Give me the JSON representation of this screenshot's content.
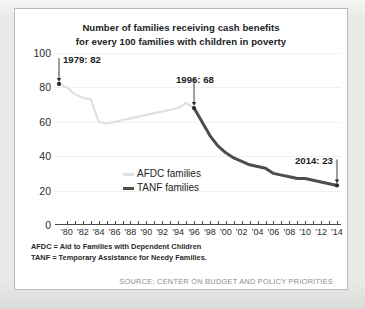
{
  "chart_data": {
    "type": "line",
    "title": "Number of families receiving cash benefits for every 100 families with children in poverty",
    "title_line1": "Number of families receiving cash benefits",
    "title_line2": "for every 100 families with children in poverty",
    "xlabel": "",
    "ylabel": "",
    "ylim": [
      0,
      100
    ],
    "xlim": [
      1979,
      2014
    ],
    "yticks": [
      0,
      20,
      40,
      60,
      80,
      100
    ],
    "ytick_labels": [
      "0",
      "20",
      "40",
      "60",
      "80",
      "100"
    ],
    "gridlines": [
      20,
      40,
      60,
      80,
      100
    ],
    "grid": true,
    "legend_position": "inside-center",
    "xticks": [
      1980,
      1981,
      1982,
      1983,
      1984,
      1985,
      1986,
      1987,
      1988,
      1989,
      1990,
      1991,
      1992,
      1993,
      1994,
      1995,
      1996,
      1997,
      1998,
      1999,
      2000,
      2001,
      2002,
      2003,
      2004,
      2005,
      2006,
      2007,
      2008,
      2009,
      2010,
      2011,
      2012,
      2013,
      2014
    ],
    "xtick_labels": [
      "'80",
      "'82",
      "'84",
      "'86",
      "'88",
      "'90",
      "'92",
      "'94",
      "'96",
      "'98",
      "'00",
      "'02",
      "'04",
      "'06",
      "'08",
      "'10",
      "'12",
      "'14"
    ],
    "xtick_label_years": [
      1980,
      1982,
      1984,
      1986,
      1988,
      1990,
      1992,
      1994,
      1996,
      1998,
      2000,
      2002,
      2004,
      2006,
      2008,
      2010,
      2012,
      2014
    ],
    "series": [
      {
        "name": "AFDC families",
        "color": "#e0e0e0",
        "x": [
          1979,
          1980,
          1981,
          1982,
          1983,
          1984,
          1985,
          1986,
          1987,
          1988,
          1989,
          1990,
          1991,
          1992,
          1993,
          1994,
          1995,
          1996
        ],
        "values": [
          82,
          80,
          76,
          74,
          73,
          60,
          59,
          60,
          61,
          62,
          63,
          64,
          65,
          66,
          67,
          68,
          71,
          68
        ]
      },
      {
        "name": "TANF families",
        "color": "#4d4d4d",
        "x": [
          1996,
          1997,
          1998,
          1999,
          2000,
          2001,
          2002,
          2003,
          2004,
          2005,
          2006,
          2007,
          2008,
          2009,
          2010,
          2011,
          2012,
          2013,
          2014
        ],
        "values": [
          68,
          60,
          52,
          46,
          42,
          39,
          37,
          35,
          34,
          33,
          30,
          29,
          28,
          27,
          27,
          26,
          25,
          24,
          23
        ]
      }
    ],
    "annotations": [
      {
        "label": "1979: 82",
        "year": 1979,
        "value": 82
      },
      {
        "label": "1996: 68",
        "year": 1996,
        "value": 68
      },
      {
        "label": "2014: 23",
        "year": 2014,
        "value": 23
      }
    ]
  },
  "legend": [
    {
      "label": "AFDC families",
      "color": "#e0e0e0"
    },
    {
      "label": "TANF families",
      "color": "#4d4d4d"
    }
  ],
  "notes": [
    "AFDC = Aid to Families with Dependent Children",
    "TANF = Temporary Assistance for Needy Families."
  ],
  "source": "SOURCE: CENTER ON BUDGET AND POLICY PRIORITIES"
}
